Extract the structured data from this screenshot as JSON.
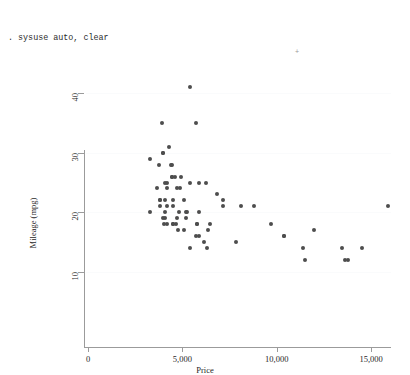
{
  "console": {
    "lines": [
      ". sysuse auto, clear",
      "(1978 Automobile Data)",
      "",
      ". twoway scatter mpg price"
    ],
    "artifact": "+"
  },
  "chart_data": {
    "type": "scatter",
    "title": "",
    "xlabel": "Price",
    "ylabel": "Mileage (mpg)",
    "xlim": [
      0,
      16000
    ],
    "ylim": [
      10,
      42
    ],
    "grid": true,
    "legend": null,
    "xticks": [
      0,
      5000,
      10000,
      15000
    ],
    "xticklabels": [
      "0",
      "5,000",
      "10,000",
      "15,000"
    ],
    "yticks": [
      10,
      20,
      30,
      40
    ],
    "yticklabels": [
      "10",
      "20",
      "30",
      "40"
    ],
    "marker_color": "#4d4d4d",
    "marker_size": 4,
    "series": [
      {
        "name": "mpg vs price",
        "points": [
          [
            4099,
            22
          ],
          [
            4749,
            17
          ],
          [
            3799,
            22
          ],
          [
            4816,
            20
          ],
          [
            7827,
            15
          ],
          [
            5788,
            18
          ],
          [
            4453,
            26
          ],
          [
            5189,
            20
          ],
          [
            10372,
            16
          ],
          [
            4082,
            19
          ],
          [
            11385,
            14
          ],
          [
            14500,
            14
          ],
          [
            15906,
            21
          ],
          [
            3299,
            29
          ],
          [
            5705,
            16
          ],
          [
            4504,
            22
          ],
          [
            5104,
            22
          ],
          [
            3667,
            24
          ],
          [
            3955,
            19
          ],
          [
            3984,
            30
          ],
          [
            4010,
            18
          ],
          [
            5886,
            16
          ],
          [
            6342,
            17
          ],
          [
            4389,
            28
          ],
          [
            4187,
            21
          ],
          [
            11497,
            12
          ],
          [
            13594,
            12
          ],
          [
            13466,
            14
          ],
          [
            3829,
            22
          ],
          [
            5379,
            14
          ],
          [
            6165,
            15
          ],
          [
            4516,
            18
          ],
          [
            6303,
            14
          ],
          [
            3291,
            20
          ],
          [
            8814,
            21
          ],
          [
            5172,
            19
          ],
          [
            4733,
            19
          ],
          [
            4890,
            24
          ],
          [
            4181,
            24
          ],
          [
            4195,
            18
          ],
          [
            10371,
            16
          ],
          [
            4647,
            18
          ],
          [
            4425,
            28
          ],
          [
            4482,
            21
          ],
          [
            6486,
            18
          ],
          [
            4060,
            20
          ],
          [
            5798,
            18
          ],
          [
            4934,
            26
          ],
          [
            5222,
            20
          ],
          [
            4723,
            24
          ],
          [
            4424,
            26
          ],
          [
            4172,
            25
          ],
          [
            9690,
            18
          ],
          [
            6850,
            23
          ],
          [
            7140,
            21
          ],
          [
            13800,
            12
          ],
          [
            5397,
            25
          ],
          [
            4082,
            25
          ],
          [
            4499,
            18
          ],
          [
            11995,
            17
          ],
          [
            5899,
            20
          ],
          [
            3995,
            30
          ],
          [
            3895,
            35
          ],
          [
            3798,
            21
          ],
          [
            5899,
            25
          ],
          [
            3748,
            28
          ],
          [
            5719,
            35
          ],
          [
            7140,
            22
          ],
          [
            5379,
            41
          ],
          [
            6229,
            25
          ],
          [
            4589,
            26
          ],
          [
            5079,
            17
          ],
          [
            8129,
            21
          ],
          [
            4296,
            31
          ]
        ]
      }
    ]
  }
}
